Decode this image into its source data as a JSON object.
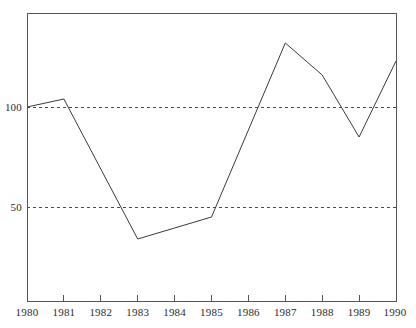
{
  "chart_data": {
    "type": "line",
    "title": "",
    "subtitle": "",
    "xlabel": "",
    "ylabel": "",
    "x": [
      1980,
      1981,
      1982,
      1983,
      1984,
      1985,
      1986,
      1987,
      1988,
      1989,
      1990
    ],
    "categories": [
      "1980",
      "1981",
      "1982",
      "1983",
      "1984",
      "1985",
      "1986",
      "1987",
      "1988",
      "1989",
      "1990"
    ],
    "values": [
      100,
      104,
      69,
      34,
      39.5,
      45,
      88,
      132,
      116,
      85,
      123
    ],
    "vertex_years": [
      1980,
      1981,
      1983,
      1985,
      1987,
      1988,
      1989,
      1990
    ],
    "vertex_values": [
      100,
      104,
      34,
      45,
      132,
      116,
      85,
      123
    ],
    "series": [
      {
        "name": "index",
        "values": [
          100,
          104,
          69,
          34,
          39.5,
          45,
          88,
          132,
          116,
          85,
          123
        ]
      }
    ],
    "xlim": [
      1980,
      1990
    ],
    "ylim": [
      0,
      144
    ],
    "ytick_values": [
      50,
      100
    ],
    "ytick_labels": [
      "50",
      "100"
    ],
    "xtick_labels": [
      "1980",
      "1981",
      "1982",
      "1983",
      "1984",
      "1985",
      "1986",
      "1987",
      "1988",
      "1989",
      "1990"
    ],
    "gridlines": "horizontal-dotted-at-50-and-100",
    "grid": true,
    "legend": "none",
    "legend_position": "none",
    "line_color": "#3a3a3a",
    "grid_color": "#4a4a4a",
    "frame_color": "#555555",
    "background_color": "#ffffff"
  },
  "axes": {
    "y_ticks": [
      {
        "label": "100",
        "value": 100
      },
      {
        "label": "50",
        "value": 50
      }
    ],
    "x_ticks": [
      {
        "label": "1980",
        "value": 1980
      },
      {
        "label": "1981",
        "value": 1981
      },
      {
        "label": "1982",
        "value": 1982
      },
      {
        "label": "1983",
        "value": 1983
      },
      {
        "label": "1984",
        "value": 1984
      },
      {
        "label": "1985",
        "value": 1985
      },
      {
        "label": "1986",
        "value": 1986
      },
      {
        "label": "1987",
        "value": 1987
      },
      {
        "label": "1988",
        "value": 1988
      },
      {
        "label": "1989",
        "value": 1989
      },
      {
        "label": "1990",
        "value": 1990
      }
    ]
  }
}
